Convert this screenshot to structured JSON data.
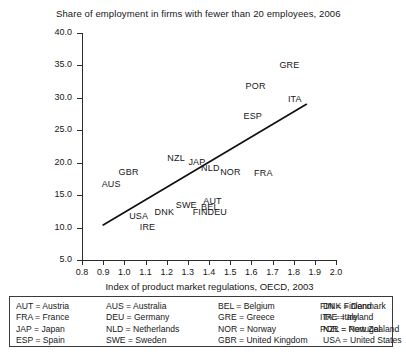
{
  "chart_data": {
    "type": "scatter",
    "title": "Share of employment in firms with fewer than 20 employees, 2006",
    "xlabel": "Index of product market regulations, OECD, 2003",
    "ylabel": "",
    "xlim": [
      0.8,
      2.0
    ],
    "ylim": [
      5.0,
      40.0
    ],
    "xticks": [
      "0.8",
      "0.9",
      "1.0",
      "1.1",
      "1.2",
      "1.3",
      "1.4",
      "1.5",
      "1.6",
      "1.7",
      "1.8",
      "1.9",
      "2.0"
    ],
    "yticks": [
      "40.0",
      "35.0",
      "30.0",
      "25.0",
      "20.0",
      "15.0",
      "10.0",
      "5.0"
    ],
    "grid": false,
    "legend_position": "below-plot",
    "marker_style": "text-label-only",
    "points": [
      {
        "label": "GBR",
        "x": 1.02,
        "y": 18.4
      },
      {
        "label": "AUS",
        "x": 0.94,
        "y": 16.6
      },
      {
        "label": "NZL",
        "x": 1.25,
        "y": 20.6
      },
      {
        "label": "USA",
        "x": 1.07,
        "y": 11.6
      },
      {
        "label": "IRE",
        "x": 1.12,
        "y": 10.0
      },
      {
        "label": "DNK",
        "x": 1.19,
        "y": 12.3
      },
      {
        "label": "SWE",
        "x": 1.29,
        "y": 13.3
      },
      {
        "label": "FIN",
        "x": 1.37,
        "y": 12.2
      },
      {
        "label": "DEU",
        "x": 1.44,
        "y": 12.2
      },
      {
        "label": "BEL",
        "x": 1.41,
        "y": 13.0
      },
      {
        "label": "AUT",
        "x": 1.42,
        "y": 13.9
      },
      {
        "label": "JAP",
        "x": 1.35,
        "y": 19.9
      },
      {
        "label": "NLD",
        "x": 1.41,
        "y": 19.0
      },
      {
        "label": "NOR",
        "x": 1.5,
        "y": 18.4
      },
      {
        "label": "FRA",
        "x": 1.66,
        "y": 18.3
      },
      {
        "label": "ESP",
        "x": 1.61,
        "y": 27.1
      },
      {
        "label": "POR",
        "x": 1.62,
        "y": 31.6
      },
      {
        "label": "GRE",
        "x": 1.78,
        "y": 34.9
      },
      {
        "label": "ITA",
        "x": 1.82,
        "y": 29.6
      }
    ],
    "trend_line": {
      "name": "fitted regression line",
      "x_start": 0.9,
      "y_start": 10.4,
      "x_end": 1.86,
      "y_end": 29.0
    }
  },
  "legend": {
    "rows": [
      [
        "AUT = Austria",
        "AUS = Australia",
        "BEL = Belgium",
        "DNK = Denmark",
        "FIN = Finland"
      ],
      [
        "FRA = France",
        "DEU = Germany",
        "GRE = Greece",
        "IRE = Ireland",
        "ITA = Italy"
      ],
      [
        "JAP = Japan",
        "NLD = Netherlands",
        "NOR = Norway",
        "NZL = New Zealand",
        "POR = Portugal"
      ],
      [
        "ESP = Spain",
        "SWE = Sweden",
        "GBR = United Kingdom",
        "USA = United States",
        ""
      ]
    ],
    "entries": [
      "AUT = Austria",
      "AUS = Australia",
      "BEL = Belgium",
      "DNK = Denmark",
      "FIN = Finland",
      "FRA = France",
      "DEU = Germany",
      "GRE = Greece",
      "IRE = Ireland",
      "ITA = Italy",
      "JAP = Japan",
      "NLD = Netherlands",
      "NOR = Norway",
      "NZL = New Zealand",
      "POR = Portugal",
      "ESP = Spain",
      "SWE = Sweden",
      "GBR = United Kingdom",
      "USA = United States"
    ]
  },
  "colors": {
    "background": "#ffffff",
    "axis": "#2b2b2b",
    "text": "#171717",
    "trend_line": "#111111",
    "legend_border": "#3a3a3a"
  }
}
